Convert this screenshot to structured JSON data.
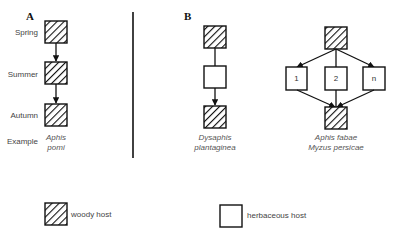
{
  "panels": {
    "a": {
      "label": "A",
      "rows": [
        "Spring",
        "Summer",
        "Autumn",
        "Example"
      ],
      "example_species": [
        "Aphis",
        "pomi"
      ]
    },
    "b": {
      "label": "B",
      "left_example_species": [
        "Dysaphis",
        "plantaginea"
      ],
      "right_example_species": [
        "Aphis fabae",
        "Myzus persicae"
      ],
      "herbaceous_numbers": [
        "1",
        "2",
        "n"
      ]
    }
  },
  "legend": {
    "woody": "woody host",
    "herbaceous": "herbaceous host"
  },
  "colors": {
    "stroke": "#111111",
    "hatch": "#111111",
    "background": "#ffffff"
  }
}
